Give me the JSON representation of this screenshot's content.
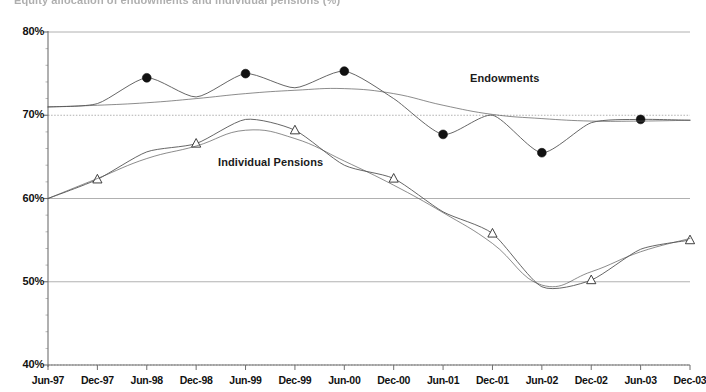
{
  "chart_data": {
    "type": "line",
    "title": "Equity allocation of endowments and individual pensions (%)",
    "xlabel": "",
    "ylabel": "",
    "ylim": [
      40,
      80
    ],
    "ytick_labels": [
      "80%",
      "70%",
      "60%",
      "50%",
      "40%"
    ],
    "ytick_values": [
      80,
      70,
      60,
      50,
      40
    ],
    "grid": true,
    "legend_position": "inline-annotations",
    "categories": [
      "Jun-97",
      "Dec-97",
      "Jun-98",
      "Dec-98",
      "Jun-99",
      "Dec-99",
      "Jun-00",
      "Dec-00",
      "Jun-01",
      "Dec-01",
      "Jun-02",
      "Dec-02",
      "Jun-03",
      "Dec-03"
    ],
    "series": [
      {
        "name": "Endowments",
        "marker": "filled-circle",
        "marker_every": 2,
        "marker_indices": [
          2,
          4,
          6,
          8,
          10,
          12
        ],
        "values": [
          71.0,
          71.4,
          74.5,
          72.2,
          75.0,
          73.3,
          75.3,
          72.0,
          67.7,
          70.0,
          65.5,
          69.1,
          69.5,
          69.4
        ]
      },
      {
        "name": "Endowments (smoothed)",
        "marker": "none",
        "values": [
          71.0,
          71.2,
          71.5,
          72.0,
          72.6,
          73.0,
          73.2,
          72.6,
          71.2,
          70.1,
          69.6,
          69.3,
          69.3,
          69.4
        ]
      },
      {
        "name": "Individual Pensions",
        "marker": "open-triangle",
        "marker_every": 2,
        "marker_indices": [
          1,
          3,
          5,
          7,
          9,
          11,
          13
        ],
        "values": [
          60.0,
          62.3,
          65.6,
          66.6,
          69.5,
          68.2,
          64.0,
          62.4,
          58.4,
          55.8,
          49.4,
          50.2,
          53.9,
          55.0
        ]
      },
      {
        "name": "Individual Pensions (smoothed)",
        "marker": "none",
        "values": [
          60.0,
          62.4,
          64.8,
          66.3,
          68.2,
          67.2,
          64.5,
          61.6,
          58.3,
          54.6,
          49.6,
          51.2,
          53.6,
          55.2
        ]
      }
    ],
    "annotations": [
      {
        "text": "Endowments",
        "x": "Dec-01",
        "y": 77.0
      },
      {
        "text": "Individual Pensions",
        "x": "Dec-98",
        "y": 65.0
      }
    ]
  },
  "axis": {
    "y_labels": [
      "80%",
      "70%",
      "60%",
      "50%",
      "40%"
    ],
    "x_labels": [
      "Jun-97",
      "Dec-97",
      "Jun-98",
      "Dec-98",
      "Jun-99",
      "Dec-99",
      "Jun-00",
      "Dec-00",
      "Jun-01",
      "Dec-01",
      "Jun-02",
      "Dec-02",
      "Jun-03",
      "Dec-03"
    ]
  },
  "labels": {
    "endowments": "Endowments",
    "pensions": "Individual Pensions",
    "title": "Equity allocation of endowments and individual pensions (%)"
  },
  "colors": {
    "line": "#555555",
    "marker_fill": "#111111",
    "marker_open": "#ffffff",
    "grid": "#8a8a8a",
    "axis": "#6f6f6f",
    "text": "#111111"
  }
}
